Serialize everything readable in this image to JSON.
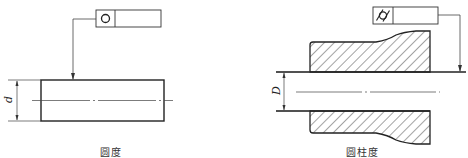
{
  "figures": [
    {
      "id": "roundness",
      "caption": "圆度",
      "tolerance_symbol": "circle-icon",
      "dimension_label": "d"
    },
    {
      "id": "cylindricity",
      "caption": "圆柱度",
      "tolerance_symbol": "cylindricity-icon",
      "dimension_label": "D"
    }
  ],
  "colors": {
    "line": "#222222",
    "thin_line": "#444444",
    "hatch": "#333333",
    "background": "#ffffff"
  }
}
